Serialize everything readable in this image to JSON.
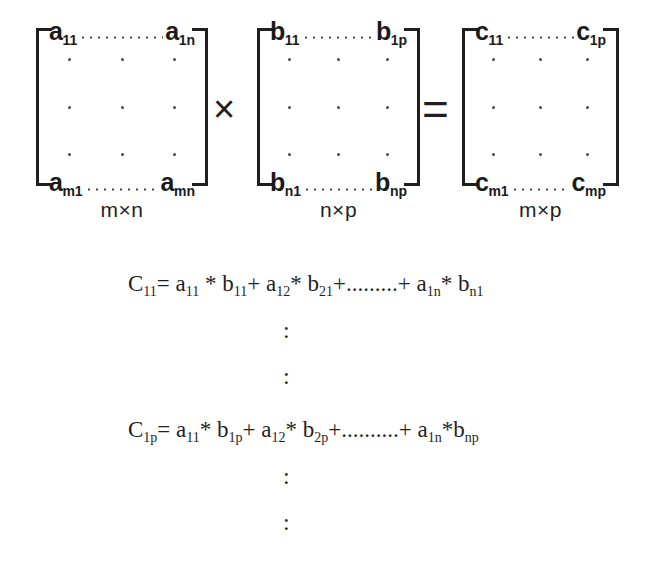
{
  "figure": {
    "operators": {
      "times": "×",
      "equals": "=",
      "vertical_dots": ":"
    },
    "matrices": [
      {
        "name": "A",
        "dimension_label": "m×n",
        "top_left": "a",
        "top_left_sub": "11",
        "top_right": "a",
        "top_right_sub": "1n",
        "bottom_left": "a",
        "bottom_left_sub": "m1",
        "bottom_right": "a",
        "bottom_right_sub": "mn"
      },
      {
        "name": "B",
        "dimension_label": "n×p",
        "top_left": "b",
        "top_left_sub": "11",
        "top_right": "b",
        "top_right_sub": "1p",
        "bottom_left": "b",
        "bottom_left_sub": "n1",
        "bottom_right": "b",
        "bottom_right_sub": "np"
      },
      {
        "name": "C",
        "dimension_label": "m×p",
        "top_left": "c",
        "top_left_sub": "11",
        "top_right": "c",
        "top_right_sub": "1p",
        "bottom_left": "c",
        "bottom_left_sub": "m1",
        "bottom_right": "c",
        "bottom_right_sub": "mp"
      }
    ],
    "equations": [
      {
        "id": "c11",
        "lhs": "C",
        "lhs_sub": "11",
        "text": "C11= a11 * b11+ a12* b21+.........+ a1n* bn1"
      },
      {
        "id": "c1p",
        "lhs": "C",
        "lhs_sub": "1p",
        "text": "C1p= a11* b1p+ a12* b2p+..........+ a1n*bnp"
      },
      {
        "id": "cmp",
        "lhs": "C",
        "lhs_sub": "mp",
        "text": "Cmp= am1* b1p+am2* b2p+.........+ amn* bnp"
      }
    ],
    "ellipsis_short": ".........",
    "ellipsis_long": "..........",
    "star": "*",
    "plus": "+",
    "eq": "="
  }
}
